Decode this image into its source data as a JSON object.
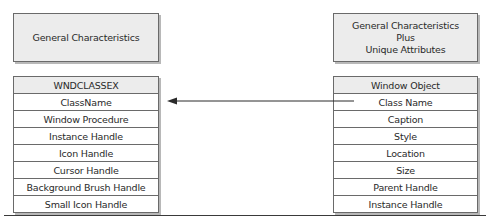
{
  "left": {
    "header_box": {
      "lines": [
        "General Characteristics"
      ]
    },
    "table": {
      "title": "WNDCLASSEX",
      "rows": [
        "ClassName",
        "Window Procedure",
        "Instance Handle",
        "Icon Handle",
        "Cursor Handle",
        "Background Brush Handle",
        "Small Icon Handle"
      ]
    }
  },
  "right": {
    "header_box": {
      "lines": [
        "General Characteristics",
        "Plus",
        "Unique Attributes"
      ]
    },
    "table": {
      "title": "Window Object",
      "rows": [
        "Class Name",
        "Caption",
        "Style",
        "Location",
        "Size",
        "Parent Handle",
        "Instance Handle"
      ]
    }
  },
  "connector": {
    "from": "Window Object.Class Name",
    "to": "WNDCLASSEX.ClassName",
    "style": "arrow"
  },
  "colors": {
    "box_fill": "#ececec",
    "border": "#6a6a6a",
    "shadow": "#b8b8b8",
    "text": "#2a2a2a"
  }
}
